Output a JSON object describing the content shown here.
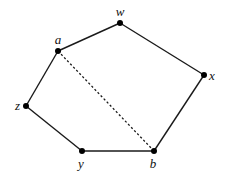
{
  "diagram": {
    "type": "graph",
    "colors": {
      "edge": "#1a1a1a",
      "node": "#000000",
      "label": "#111111",
      "background": "#ffffff"
    },
    "nodes": [
      {
        "id": "w",
        "label": "w",
        "x": 120,
        "y": 23,
        "label_x": 120,
        "label_y": 16,
        "anchor": "middle"
      },
      {
        "id": "a",
        "label": "a",
        "x": 58,
        "y": 51,
        "label_x": 58,
        "label_y": 44,
        "anchor": "middle"
      },
      {
        "id": "x",
        "label": "x",
        "x": 204,
        "y": 75,
        "label_x": 209,
        "label_y": 80,
        "anchor": "start"
      },
      {
        "id": "z",
        "label": "z",
        "x": 26,
        "y": 106,
        "label_x": 20,
        "label_y": 110,
        "anchor": "end"
      },
      {
        "id": "y",
        "label": "y",
        "x": 82,
        "y": 151,
        "label_x": 81,
        "label_y": 168,
        "anchor": "middle"
      },
      {
        "id": "b",
        "label": "b",
        "x": 154,
        "y": 151,
        "label_x": 153,
        "label_y": 168,
        "anchor": "middle"
      }
    ],
    "edges": [
      {
        "from": "a",
        "to": "w",
        "style": "solid"
      },
      {
        "from": "w",
        "to": "x",
        "style": "solid"
      },
      {
        "from": "x",
        "to": "b",
        "style": "solid"
      },
      {
        "from": "b",
        "to": "y",
        "style": "solid"
      },
      {
        "from": "y",
        "to": "z",
        "style": "solid"
      },
      {
        "from": "z",
        "to": "a",
        "style": "solid"
      },
      {
        "from": "a",
        "to": "b",
        "style": "dashed"
      }
    ]
  }
}
